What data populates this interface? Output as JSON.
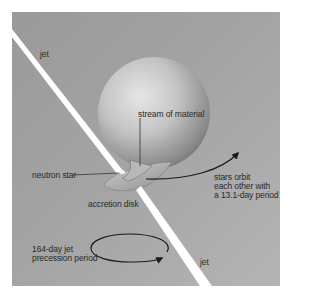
{
  "diagram": {
    "labels": {
      "jet_top": "jet",
      "jet_bottom": "jet",
      "stream": "stream of material",
      "neutron_star": "neutron star",
      "accretion_disk": "accretion disk",
      "orbit_line1": "stars orbit",
      "orbit_line2": "each other with",
      "orbit_line3": "a 13.1-day period",
      "precession_line1": "164-day jet",
      "precession_line2": "precession period"
    },
    "colors": {
      "background": "#a3a3a3",
      "jet": "#ffffff",
      "text": "#2a2a2a",
      "arrow": "#1a1a1a"
    }
  }
}
